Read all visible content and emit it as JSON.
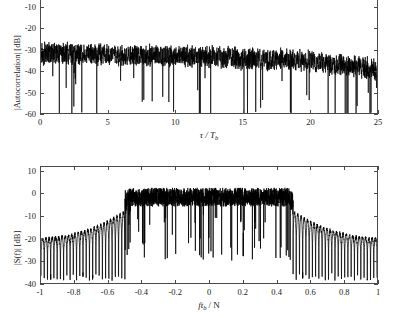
{
  "figure": {
    "background": "#ffffff",
    "trace_color": "#000000",
    "axis_color": "#4a4a4a"
  },
  "chart_data": [
    {
      "id": "autocorrelation",
      "type": "line",
      "title": "",
      "xlabel": "τ / T_b",
      "xlabel_parts": {
        "main": "τ / T",
        "sub": "b"
      },
      "ylabel": "|Autocorrelation| [dB]",
      "xlim": [
        0,
        25
      ],
      "ylim": [
        -60,
        -5
      ],
      "xticks": [
        0,
        5,
        10,
        15,
        20,
        25
      ],
      "xticklabels": [
        "0",
        "5",
        "10",
        "15",
        "20",
        "25"
      ],
      "yticks": [
        -10,
        -20,
        -30,
        -40,
        -50,
        -60
      ],
      "yticklabels": [
        "-10",
        "-20",
        "-30",
        "-40",
        "-50",
        "-60"
      ],
      "grid": false,
      "legend": null,
      "top_frame_visible": false,
      "description": "Dense noise-like magnitude of autocorrelation sidelobes, mean level near -33 dB, slowly decaying to about -40 dB near tau/Tb = 25, with deep nulls reaching below -60 dB.",
      "envelope_mean_db": [
        -32,
        -32,
        -32.5,
        -33,
        -33,
        -33,
        -33.5,
        -34,
        -34.5,
        -35,
        -36,
        -37,
        -38.5,
        -40
      ],
      "envelope_x": [
        0,
        2,
        4,
        6,
        8,
        10,
        12,
        14,
        16,
        18,
        20,
        22,
        24,
        25
      ],
      "peak_top_db": -22,
      "floor_db": -60
    },
    {
      "id": "spectrum",
      "type": "line",
      "title": "",
      "xlabel": "f T_b / N",
      "xlabel_parts": {
        "pre": "f",
        "main": "t",
        "sub": "b",
        "post": "/ N"
      },
      "ylabel": "|S(f)| [dB]",
      "xlim": [
        -1,
        1
      ],
      "ylim": [
        -40,
        12
      ],
      "xticks": [
        -1,
        -0.8,
        -0.6,
        -0.4,
        -0.2,
        0,
        0.2,
        0.4,
        0.6,
        0.8,
        1
      ],
      "xticklabels": [
        "-1",
        "-0.8",
        "-0.6",
        "-0.4",
        "-0.2",
        "0",
        "0.2",
        "0.4",
        "0.6",
        "0.8",
        "1"
      ],
      "yticks": [
        10,
        0,
        -10,
        -20,
        -30,
        -40
      ],
      "yticklabels": [
        "10",
        "0",
        "-10",
        "-20",
        "-30",
        "-40"
      ],
      "grid": false,
      "legend": null,
      "top_frame_visible": true,
      "description": "Band-limited power spectrum: flat noisy passband near 0 dB between f*Tb/N = -0.5 and +0.5 with peaks to +8 dB and deep notches to -28 dB; outside the band a comb of discrete sidelobe spikes whose tops rise from about -20 dB at |f|=1 to -8 dB near the band edges, over a floor near -30 dB.",
      "passband_edges": [
        -0.5,
        0.5
      ],
      "passband_mean_db": -1.5,
      "passband_peak_db": 8,
      "sidelobe_peak_edge_db": -8,
      "sidelobe_peak_far_db": -20,
      "sidelobe_floor_db": -31,
      "sidelobe_comb_count": 26
    }
  ]
}
